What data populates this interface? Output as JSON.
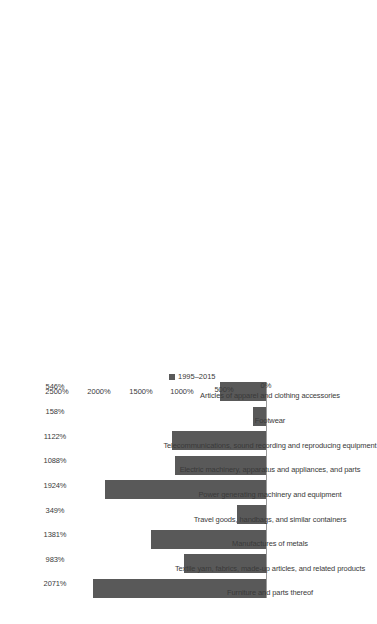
{
  "chart_data": {
    "type": "bar",
    "title": "",
    "xlabel": "",
    "ylabel": "",
    "orientation": "vertical-rotated",
    "grid": false,
    "legend_position": "bottom-right",
    "legend": [
      "1995–2015"
    ],
    "ylim": [
      0,
      2500
    ],
    "ytick_labels": [
      "0%",
      "500%",
      "1000%",
      "1500%",
      "2000%",
      "2500%"
    ],
    "ytick_values": [
      0,
      500,
      1000,
      1500,
      2000,
      2500
    ],
    "categories": [
      "Furniture and parts thereof",
      "Textile yarn, fabrics, made-up articles, and related products",
      "Manufactures of metals",
      "Travel goods, handbags, and similar containers",
      "Power generating machinery and equipment",
      "Electric machinery, apparatus and appliances, and parts",
      "Telecommunications, sound recording and reproducing equipment",
      "Footwear",
      "Articles of apparel and clothing accessories"
    ],
    "values": [
      2071,
      983,
      1381,
      349,
      1924,
      1088,
      1122,
      158,
      546
    ],
    "value_labels": [
      "2071%",
      "983%",
      "1381%",
      "349%",
      "1924%",
      "1088%",
      "1122%",
      "158%",
      "546%"
    ],
    "series": [
      {
        "name": "1995–2015",
        "color": "#595959",
        "values": [
          2071,
          983,
          1381,
          349,
          1924,
          1088,
          1122,
          158,
          546
        ]
      }
    ]
  }
}
